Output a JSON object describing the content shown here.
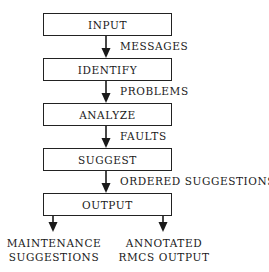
{
  "diagram": {
    "type": "flowchart",
    "boxes": [
      {
        "label": "INPUT"
      },
      {
        "label": "IDENTIFY"
      },
      {
        "label": "ANALYZE"
      },
      {
        "label": "SUGGEST"
      },
      {
        "label": "OUTPUT"
      }
    ],
    "edges": [
      {
        "from": "INPUT",
        "to": "IDENTIFY",
        "label": "MESSAGES"
      },
      {
        "from": "IDENTIFY",
        "to": "ANALYZE",
        "label": "PROBLEMS"
      },
      {
        "from": "ANALYZE",
        "to": "SUGGEST",
        "label": "FAULTS"
      },
      {
        "from": "SUGGEST",
        "to": "OUTPUT",
        "label": "ORDERED SUGGESTIONS"
      }
    ],
    "outputs": [
      {
        "line1": "MAINTENANCE",
        "line2": "SUGGESTIONS"
      },
      {
        "line1": "ANNOTATED",
        "line2": "RMCS OUTPUT"
      }
    ]
  }
}
